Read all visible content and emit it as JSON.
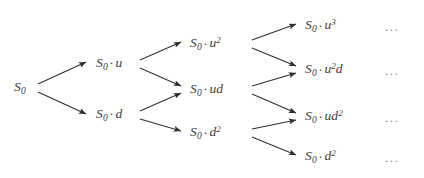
{
  "diagram": {
    "type": "binomial-tree",
    "background_color": "#ffffff",
    "text_color": "#3b3b3b",
    "edge_color": "#2e2e2e",
    "ellipsis_color": "#8e8e8e",
    "continuation_mark": "...",
    "nodes": [
      {
        "id": "n0",
        "label": "S0",
        "base": "S",
        "sub": "0",
        "dot": false,
        "factor": "",
        "factor_sup": "",
        "column": 0,
        "row": 0,
        "x": 14,
        "y": 88
      },
      {
        "id": "n1u",
        "label": "S0 · u",
        "base": "S",
        "sub": "0",
        "dot": true,
        "factor": "u",
        "factor_sup": "",
        "column": 1,
        "row": 0,
        "x": 96,
        "y": 64
      },
      {
        "id": "n1d",
        "label": "S0 · d",
        "base": "S",
        "sub": "0",
        "dot": true,
        "factor": "d",
        "factor_sup": "",
        "column": 1,
        "row": 1,
        "x": 96,
        "y": 115
      },
      {
        "id": "n2uu",
        "label": "S0 · u2",
        "base": "S",
        "sub": "0",
        "dot": true,
        "factor": "u",
        "factor_sup": "2",
        "column": 2,
        "row": 0,
        "x": 190,
        "y": 44
      },
      {
        "id": "n2ud",
        "label": "S0 · ud",
        "base": "S",
        "sub": "0",
        "dot": true,
        "factor": "ud",
        "factor_sup": "",
        "column": 2,
        "row": 1,
        "x": 190,
        "y": 90
      },
      {
        "id": "n2dd",
        "label": "S0 · d2",
        "base": "S",
        "sub": "0",
        "dot": true,
        "factor": "d",
        "factor_sup": "2",
        "column": 2,
        "row": 2,
        "x": 190,
        "y": 133
      },
      {
        "id": "n3uuu",
        "label": "S0 · u3",
        "base": "S",
        "sub": "0",
        "dot": true,
        "factor": "u",
        "factor_sup": "3",
        "column": 3,
        "row": 0,
        "x": 305,
        "y": 26
      },
      {
        "id": "n3uud",
        "label": "S0 · u2d",
        "base": "S",
        "sub": "0",
        "dot": true,
        "factor": "u",
        "factor_sup": "2",
        "factor_tail": "d",
        "column": 3,
        "row": 1,
        "x": 305,
        "y": 70
      },
      {
        "id": "n3udd",
        "label": "S0 · ud2",
        "base": "S",
        "sub": "0",
        "dot": true,
        "factor": "ud",
        "factor_sup": "2",
        "column": 3,
        "row": 2,
        "x": 305,
        "y": 117
      },
      {
        "id": "n3ddd",
        "label": "S0 · d2",
        "base": "S",
        "sub": "0",
        "dot": true,
        "factor": "d",
        "factor_sup": "2",
        "column": 3,
        "row": 3,
        "x": 305,
        "y": 157
      }
    ],
    "ellipses": [
      {
        "id": "e0",
        "text": "...",
        "x": 385,
        "y": 26
      },
      {
        "id": "e1",
        "text": "...",
        "x": 385,
        "y": 70
      },
      {
        "id": "e2",
        "text": "...",
        "x": 385,
        "y": 117
      },
      {
        "id": "e3",
        "text": "...",
        "x": 385,
        "y": 157
      }
    ],
    "edges": [
      {
        "id": "ed0",
        "from": "n0",
        "to": "n1u",
        "direction": "up",
        "x1": 38,
        "y1": 84,
        "x2": 86,
        "y2": 62
      },
      {
        "id": "ed1",
        "from": "n0",
        "to": "n1d",
        "direction": "down",
        "x1": 38,
        "y1": 92,
        "x2": 86,
        "y2": 114
      },
      {
        "id": "ed2",
        "from": "n1u",
        "to": "n2uu",
        "direction": "up",
        "x1": 140,
        "y1": 60,
        "x2": 181,
        "y2": 42
      },
      {
        "id": "ed3",
        "from": "n1u",
        "to": "n2ud",
        "direction": "down",
        "x1": 140,
        "y1": 68,
        "x2": 181,
        "y2": 86
      },
      {
        "id": "ed4",
        "from": "n1d",
        "to": "n2ud",
        "direction": "up",
        "x1": 140,
        "y1": 111,
        "x2": 181,
        "y2": 93
      },
      {
        "id": "ed5",
        "from": "n1d",
        "to": "n2dd",
        "direction": "down",
        "x1": 140,
        "y1": 119,
        "x2": 181,
        "y2": 131
      },
      {
        "id": "ed6",
        "from": "n2uu",
        "to": "n3uuu",
        "direction": "up",
        "x1": 252,
        "y1": 40,
        "x2": 296,
        "y2": 24
      },
      {
        "id": "ed7",
        "from": "n2uu",
        "to": "n3uud",
        "direction": "down",
        "x1": 252,
        "y1": 48,
        "x2": 296,
        "y2": 66
      },
      {
        "id": "ed8",
        "from": "n2ud",
        "to": "n3uud",
        "direction": "up",
        "x1": 252,
        "y1": 86,
        "x2": 296,
        "y2": 73
      },
      {
        "id": "ed9",
        "from": "n2ud",
        "to": "n3udd",
        "direction": "down",
        "x1": 252,
        "y1": 94,
        "x2": 296,
        "y2": 113
      },
      {
        "id": "ed10",
        "from": "n2dd",
        "to": "n3udd",
        "direction": "up",
        "x1": 252,
        "y1": 129,
        "x2": 296,
        "y2": 120
      },
      {
        "id": "ed11",
        "from": "n2dd",
        "to": "n3ddd",
        "direction": "down",
        "x1": 252,
        "y1": 137,
        "x2": 296,
        "y2": 155
      }
    ]
  }
}
